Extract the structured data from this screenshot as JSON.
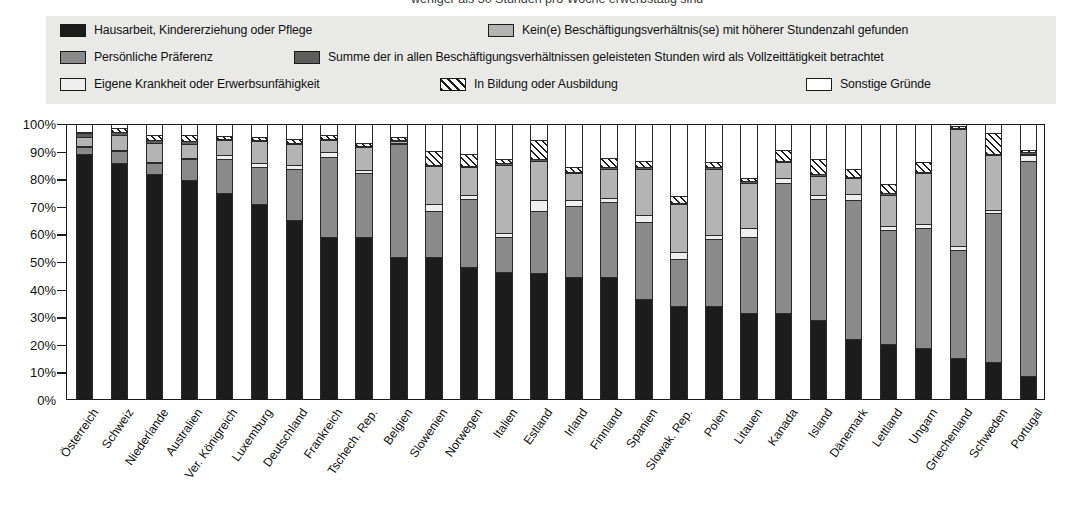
{
  "caption": {
    "cutoff_line": "weniger als 30 Stunden pro Woche erwerbstätig sind"
  },
  "legend": {
    "items": [
      {
        "key": "house",
        "label": "Hausarbeit, Kindererziehung oder Pflege",
        "swatch": "solid-dark",
        "color": "#1c1c1c"
      },
      {
        "key": "nohigher",
        "label": "Kein(e) Beschäftigungsverhältnis(se) mit höherer Stundenzahl gefunden",
        "swatch": "solid-light-gray",
        "color": "#b4b4b4"
      },
      {
        "key": "pref",
        "label": "Persönliche Präferenz",
        "swatch": "solid-mid-gray",
        "color": "#8a8a8a"
      },
      {
        "key": "sum",
        "label": "Summe der in allen Beschäftigungsverhältnissen geleisteten Stunden wird als Vollzeittätigkeit betrachtet",
        "swatch": "solid-dark-gray",
        "color": "#5d5d5d"
      },
      {
        "key": "ill",
        "label": "Eigene Krankheit oder Erwerbsunfähigkeit",
        "swatch": "solid-pale",
        "color": "#efefef"
      },
      {
        "key": "edu",
        "label": "In Bildung oder Ausbildung",
        "swatch": "hatched",
        "color": "#ffffff"
      },
      {
        "key": "other",
        "label": "Sonstige Gründe",
        "swatch": "solid-white",
        "color": "#ffffff"
      }
    ]
  },
  "chart_data": {
    "type": "bar",
    "stacked": true,
    "stack_mode": "percent",
    "title": "",
    "xlabel": "",
    "ylabel": "",
    "ylim": [
      0,
      100
    ],
    "yticks": [
      "0%",
      "10%",
      "20%",
      "30%",
      "40%",
      "50%",
      "60%",
      "70%",
      "80%",
      "90%",
      "100%"
    ],
    "grid": false,
    "legend_position": "top",
    "categories": [
      "Österreich",
      "Schweiz",
      "Niederlande",
      "Australien",
      "Ver. Königreich",
      "Luxemburg",
      "Deutschland",
      "Frankreich",
      "Tschech. Rep.",
      "Belgien",
      "Slowenien",
      "Norwegen",
      "Italien",
      "Estland",
      "Irland",
      "Finnland",
      "Spanien",
      "Slowak. Rep.",
      "Polen",
      "Litauen",
      "Kanada",
      "Island",
      "Dänemark",
      "Lettland",
      "Ungarn",
      "Griechenland",
      "Schweden",
      "Portugal"
    ],
    "series": [
      {
        "name": "Hausarbeit, Kindererziehung oder Pflege",
        "key": "house",
        "values": [
          89.5,
          86.0,
          82.0,
          80.0,
          75.0,
          71.0,
          65.5,
          59.0,
          59.0,
          52.0,
          52.0,
          48.0,
          46.5,
          46.0,
          44.5,
          44.5,
          36.5,
          34.0,
          34.0,
          31.5,
          31.5,
          29.0,
          22.0,
          20.0,
          18.5,
          15.0,
          13.5,
          8.5
        ]
      },
      {
        "name": "Persönliche Präferenz",
        "key": "pref",
        "values": [
          2.5,
          4.5,
          4.0,
          7.5,
          12.5,
          13.5,
          18.5,
          29.5,
          23.5,
          41.0,
          16.5,
          25.0,
          12.5,
          22.5,
          26.0,
          27.5,
          28.0,
          17.0,
          24.5,
          27.5,
          47.5,
          44.0,
          50.5,
          41.5,
          44.0,
          39.5,
          54.5,
          78.5
        ]
      },
      {
        "name": "Eigene Krankheit oder Erwerbsunfähigkeit",
        "key": "ill",
        "values": [
          0.5,
          0.5,
          0.5,
          0.5,
          1.5,
          1.5,
          1.5,
          1.5,
          1.0,
          0.5,
          2.5,
          1.5,
          1.5,
          4.0,
          2.0,
          1.5,
          2.5,
          2.5,
          1.5,
          3.5,
          1.5,
          1.5,
          2.5,
          1.5,
          1.5,
          1.5,
          1.0,
          2.0
        ]
      },
      {
        "name": "Kein(e) Beschäftigungsverhältnis(se) mit höherer Stundenzahl gefunden",
        "key": "nohigher",
        "values": [
          3.0,
          5.5,
          7.0,
          5.0,
          5.5,
          8.0,
          7.5,
          4.5,
          8.5,
          0.5,
          14.0,
          10.0,
          25.0,
          14.5,
          10.0,
          10.5,
          17.0,
          17.5,
          24.0,
          16.5,
          6.0,
          7.0,
          5.5,
          11.5,
          18.5,
          42.5,
          20.0,
          0.5
        ]
      },
      {
        "name": "Summe der in allen Beschäftigungsverhältnissen geleisteten Stunden wird als Vollzeittätigkeit betrachtet",
        "key": "sum",
        "values": [
          1.5,
          1.0,
          1.0,
          1.0,
          0.5,
          0.5,
          0.5,
          0.5,
          0.5,
          0.5,
          0.5,
          0.5,
          0.5,
          0.5,
          0.5,
          0.5,
          0.5,
          0.5,
          0.5,
          0.5,
          0.5,
          0.5,
          0.5,
          0.5,
          0.5,
          0.5,
          0.5,
          0.5
        ]
      },
      {
        "name": "In Bildung oder Ausbildung",
        "key": "edu",
        "values": [
          0.5,
          1.5,
          2.0,
          2.5,
          1.0,
          1.0,
          1.5,
          1.5,
          1.0,
          1.0,
          5.0,
          4.5,
          1.5,
          7.0,
          1.5,
          3.5,
          2.5,
          2.5,
          2.0,
          1.0,
          4.0,
          5.5,
          3.0,
          3.5,
          3.5,
          0.5,
          7.5,
          1.0
        ]
      },
      {
        "name": "Sonstige Gründe",
        "key": "other",
        "values": [
          2.5,
          1.0,
          3.5,
          3.5,
          4.0,
          4.5,
          5.0,
          3.5,
          6.5,
          4.5,
          9.5,
          10.5,
          12.5,
          5.5,
          15.5,
          12.0,
          13.0,
          26.0,
          13.5,
          19.5,
          9.0,
          12.5,
          16.0,
          21.5,
          13.5,
          0.5,
          3.0,
          9.0
        ]
      }
    ]
  }
}
